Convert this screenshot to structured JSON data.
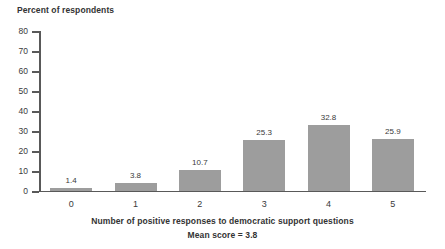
{
  "chart_data": {
    "type": "bar",
    "title": "",
    "ylabel": "Percent of respondents",
    "xlabel": "Number of positive responses to democratic support questions",
    "annotation": "Mean score = 3.8",
    "categories": [
      "0",
      "1",
      "2",
      "3",
      "4",
      "5"
    ],
    "values": [
      1.4,
      3.8,
      10.7,
      25.3,
      32.8,
      25.9
    ],
    "value_labels": [
      "1.4",
      "3.8",
      "10.7",
      "25.3",
      "32.8",
      "25.9"
    ],
    "ylim": [
      0,
      80
    ],
    "ytick_step": 10,
    "yticks": [
      0,
      10,
      20,
      30,
      40,
      50,
      60,
      70,
      80
    ],
    "ytick_labels": [
      "0",
      "10",
      "20",
      "30",
      "40",
      "50",
      "60",
      "70",
      "80"
    ],
    "grid": false,
    "legend": null,
    "bar_color": "#9d9d9d",
    "axis_color": "#595959",
    "text_color": "#3a3a3a",
    "background": "#ffffff"
  }
}
